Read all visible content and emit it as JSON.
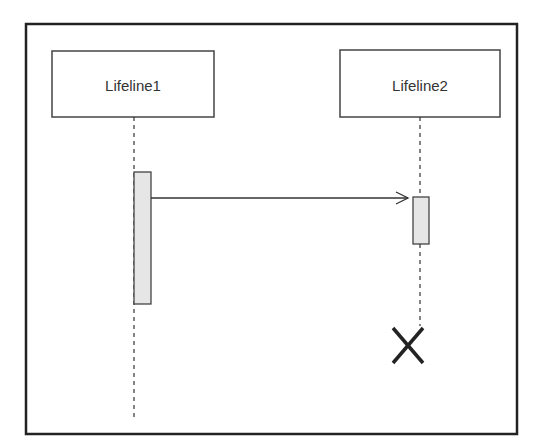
{
  "diagram": {
    "type": "UML sequence diagram",
    "lifelines": [
      {
        "label": "Lifeline1"
      },
      {
        "label": "Lifeline2"
      }
    ],
    "messages": [
      {
        "from": "Lifeline1",
        "to": "Lifeline2",
        "style": "open-arrow"
      }
    ],
    "destruction": {
      "lifeline": "Lifeline2",
      "icon": "x-destroy-icon"
    }
  }
}
